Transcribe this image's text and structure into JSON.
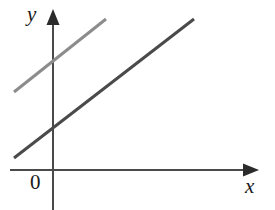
{
  "figure": {
    "width": 275,
    "height": 210,
    "background_color": "#ffffff"
  },
  "labels": {
    "y_axis": "y",
    "x_axis": "x",
    "origin": "0"
  },
  "colors": {
    "axis": "#4a4a4a",
    "line_light": "#8c8c8c",
    "line_dark": "#4a4a4a",
    "text": "#1a1a1a",
    "background": "#ffffff"
  },
  "chart_data": {
    "type": "line",
    "xlabel": "x",
    "ylabel": "y",
    "grid": false,
    "legend": "none",
    "axes": {
      "origin_label": "0",
      "origin_px": [
        53,
        170
      ],
      "x_axis_px": {
        "x1": 10,
        "y1": 170,
        "x2": 258,
        "y2": 170,
        "arrow": "right"
      },
      "y_axis_px": {
        "x1": 53,
        "y1": 10,
        "x2": 53,
        "y2": 210,
        "arrow": "up"
      },
      "x_tick_labels": [],
      "y_tick_labels": []
    },
    "series": [
      {
        "name": "upper-line",
        "color": "#8c8c8c",
        "stroke_width": 3,
        "points_px": [
          [
            14,
            92
          ],
          [
            106,
            19
          ]
        ],
        "slope_px": -0.793,
        "y_intercept_px": 65,
        "note": "light gray line, steeper position above the dark line, parallel to it"
      },
      {
        "name": "lower-line",
        "color": "#4a4a4a",
        "stroke_width": 3,
        "points_px": [
          [
            14,
            158
          ],
          [
            194,
            19
          ]
        ],
        "slope_px": -0.772,
        "y_intercept_px": 134,
        "note": "dark gray line, crosses y-axis lower, parallel to the light gray line"
      }
    ]
  }
}
